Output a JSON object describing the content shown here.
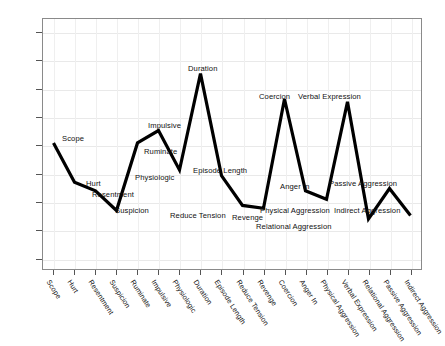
{
  "chart_data": {
    "type": "line",
    "title": "",
    "xlabel": "",
    "ylabel": "Mean T Score",
    "ylim": [
      38,
      82.5
    ],
    "yticks": [
      40,
      45,
      50,
      55,
      60,
      65,
      70,
      75,
      80
    ],
    "grid": true,
    "legend": "none",
    "line_color": "#000000",
    "line_width": 3,
    "categories": [
      "Scope",
      "Hurt",
      "Resentment",
      "Suspicion",
      "Ruminate",
      "Impulsive",
      "Physiologic",
      "Duration",
      "Episode Length",
      "Reduce Tension",
      "Revenge",
      "Coercion",
      "Anger In",
      "Physical Aggression",
      "Verbal Expression",
      "Relational Aggression",
      "Passive Aggression",
      "Indirect Aggression"
    ],
    "values": [
      60.5,
      53.5,
      52.0,
      48.5,
      60.5,
      62.7,
      55.7,
      72.8,
      54.7,
      49.4,
      48.9,
      68.3,
      52.0,
      50.5,
      67.8,
      47.0,
      52.4,
      47.6
    ],
    "point_labels": [
      {
        "text": "Scope",
        "x": 62,
        "y": 134
      },
      {
        "text": "Hurt",
        "x": 86,
        "y": 179
      },
      {
        "text": "Resentment",
        "x": 92,
        "y": 190
      },
      {
        "text": "Suspicion",
        "x": 115,
        "y": 206
      },
      {
        "text": "Ruminate",
        "x": 144,
        "y": 147
      },
      {
        "text": "Impulsive",
        "x": 148,
        "y": 121
      },
      {
        "text": "Physiologic",
        "x": 135,
        "y": 173
      },
      {
        "text": "Duration",
        "x": 188,
        "y": 64
      },
      {
        "text": "Episode Length",
        "x": 193,
        "y": 166
      },
      {
        "text": "Reduce Tension",
        "x": 170,
        "y": 211
      },
      {
        "text": "Revenge",
        "x": 232,
        "y": 213
      },
      {
        "text": "Coercion",
        "x": 259,
        "y": 92
      },
      {
        "text": "Anger In",
        "x": 280,
        "y": 182
      },
      {
        "text": "Physical Aggression",
        "x": 260,
        "y": 206
      },
      {
        "text": "Relational Aggression",
        "x": 256,
        "y": 222
      },
      {
        "text": "Verbal Expression",
        "x": 298,
        "y": 92
      },
      {
        "text": "Passive Aggression",
        "x": 329,
        "y": 179
      },
      {
        "text": "Indirect Aggression",
        "x": 334,
        "y": 206
      }
    ]
  }
}
